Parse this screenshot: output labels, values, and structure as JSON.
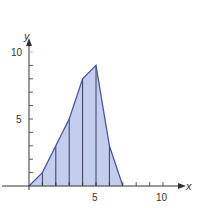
{
  "chart_data": {
    "type": "area",
    "title": "",
    "xlabel": "x",
    "ylabel": "y",
    "x": [
      0,
      1,
      2,
      3,
      4,
      5,
      6,
      7
    ],
    "series": [
      {
        "name": "f(x)",
        "values": [
          0,
          1,
          3,
          5,
          8,
          9,
          3,
          0
        ]
      }
    ],
    "xlim": [
      0,
      11.5
    ],
    "ylim": [
      0,
      11.5
    ],
    "x_ticks": [
      1,
      2,
      3,
      4,
      5,
      6,
      7,
      8,
      9,
      10
    ],
    "x_tick_labels": {
      "5": "5",
      "10": "10"
    },
    "y_ticks": [
      1,
      2,
      3,
      4,
      5,
      6,
      7,
      8,
      9,
      10
    ],
    "y_tick_labels": {
      "5": "5",
      "10": "10"
    },
    "vertical_strips": true,
    "grid": false,
    "colors": {
      "fill": "#c5cdef",
      "stroke": "#4a56a6",
      "strip": "#3b3b5a",
      "axis": "#333333"
    }
  },
  "labels": {
    "x_axis": "x",
    "y_axis": "y",
    "x5": "5",
    "x10": "10",
    "y5": "5",
    "y10": "10"
  }
}
